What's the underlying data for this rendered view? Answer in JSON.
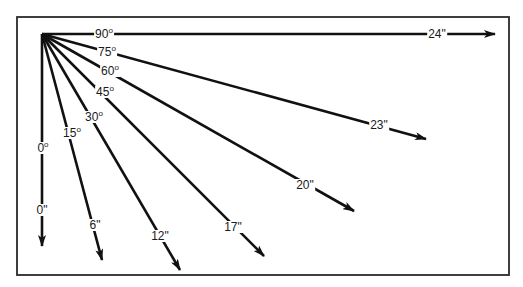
{
  "diagram": {
    "frame": {
      "x": 17,
      "y": 17,
      "width": 492,
      "height": 258,
      "stroke": "#2a2a2a"
    },
    "origin": {
      "x": 42,
      "y": 34
    },
    "line_color": "#111111",
    "rays": [
      {
        "id": "ray-0",
        "angle_label": "0",
        "angle_unit": "o",
        "distance_label": "0\"",
        "tip": {
          "x": 42,
          "y": 246
        },
        "angle_label_pos": {
          "x": 43,
          "y": 148
        },
        "distance_label_pos": {
          "x": 42,
          "y": 210
        }
      },
      {
        "id": "ray-15",
        "angle_label": "15",
        "angle_unit": "o",
        "distance_label": "6\"",
        "tip": {
          "x": 102,
          "y": 260
        },
        "angle_label_pos": {
          "x": 72,
          "y": 133
        },
        "distance_label_pos": {
          "x": 95,
          "y": 225
        }
      },
      {
        "id": "ray-30",
        "angle_label": "30",
        "angle_unit": "o",
        "distance_label": "12\"",
        "tip": {
          "x": 180,
          "y": 270
        },
        "angle_label_pos": {
          "x": 94,
          "y": 117
        },
        "distance_label_pos": {
          "x": 160,
          "y": 236
        }
      },
      {
        "id": "ray-45",
        "angle_label": "45",
        "angle_unit": "o",
        "distance_label": "17\"",
        "tip": {
          "x": 264,
          "y": 256
        },
        "angle_label_pos": {
          "x": 105,
          "y": 92
        },
        "distance_label_pos": {
          "x": 233,
          "y": 227
        }
      },
      {
        "id": "ray-60",
        "angle_label": "60",
        "angle_unit": "o",
        "distance_label": "20\"",
        "tip": {
          "x": 354,
          "y": 211
        },
        "angle_label_pos": {
          "x": 110,
          "y": 71
        },
        "distance_label_pos": {
          "x": 305,
          "y": 185
        }
      },
      {
        "id": "ray-75",
        "angle_label": "75",
        "angle_unit": "o",
        "distance_label": "23\"",
        "tip": {
          "x": 426,
          "y": 139
        },
        "angle_label_pos": {
          "x": 107,
          "y": 52
        },
        "distance_label_pos": {
          "x": 379,
          "y": 125
        }
      },
      {
        "id": "ray-90",
        "angle_label": "90",
        "angle_unit": "o",
        "distance_label": "24\"",
        "tip": {
          "x": 495,
          "y": 34
        },
        "angle_label_pos": {
          "x": 104,
          "y": 34
        },
        "distance_label_pos": {
          "x": 437,
          "y": 34
        }
      }
    ]
  }
}
